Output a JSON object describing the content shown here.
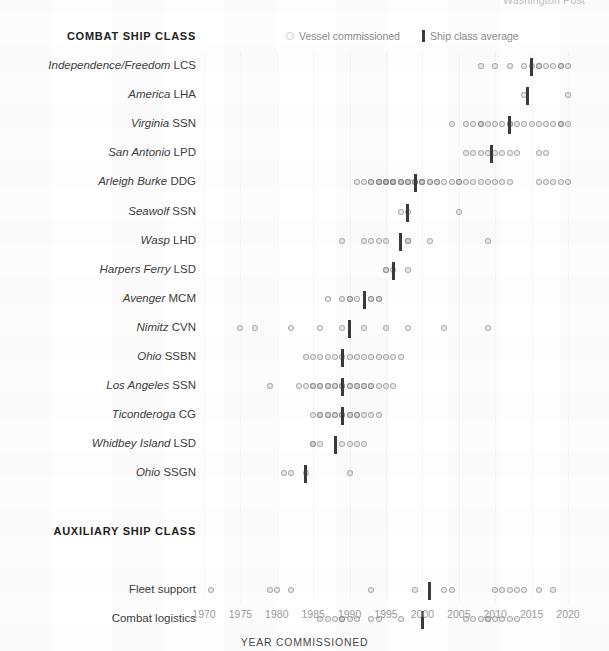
{
  "clipped_header": "Washington Post",
  "legend": {
    "dot_label": "Vessel commissioned",
    "bar_label": "Ship class average",
    "dot_icon": "circle-outline-icon",
    "bar_icon": "vertical-bar-icon"
  },
  "sections": {
    "combat_title": "COMBAT SHIP CLASS",
    "auxiliary_title": "AUXILIARY SHIP CLASS"
  },
  "axis": {
    "title": "YEAR COMMISSIONED",
    "ticks": [
      1970,
      1975,
      1980,
      1985,
      1990,
      1995,
      2000,
      2005,
      2010,
      2015,
      2020
    ],
    "min": 1968,
    "max": 2021
  },
  "colors": {
    "dot_stroke": "#8a8a8a",
    "avg_bar": "#3a3a3a",
    "text": "#3d3d3d",
    "tick_text": "#9a9a9a",
    "gridline": "#f0f0f0",
    "background": "#ffffff"
  },
  "chart_data": {
    "type": "scatter",
    "title": "COMBAT SHIP CLASS",
    "xlabel": "YEAR COMMISSIONED",
    "ylabel": "",
    "xlim": [
      1968,
      2021
    ],
    "grid": true,
    "legend_position": "top",
    "series": [
      {
        "group": "combat",
        "name_italic": "Independence/Freedom",
        "name_plain": "LCS",
        "average": 2015.0,
        "values": [
          2008,
          2010,
          2012,
          2014,
          2015,
          2016,
          2016,
          2017,
          2018,
          2019,
          2019,
          2020
        ]
      },
      {
        "group": "combat",
        "name_italic": "America",
        "name_plain": "LHA",
        "average": 2014.5,
        "values": [
          2014,
          2020
        ]
      },
      {
        "group": "combat",
        "name_italic": "Virginia",
        "name_plain": "SSN",
        "average": 2012.0,
        "values": [
          2004,
          2006,
          2007,
          2008,
          2008,
          2009,
          2010,
          2011,
          2012,
          2012,
          2013,
          2014,
          2015,
          2016,
          2017,
          2018,
          2019,
          2019,
          2020
        ]
      },
      {
        "group": "combat",
        "name_italic": "San Antonio",
        "name_plain": "LPD",
        "average": 2009.5,
        "values": [
          2006,
          2007,
          2008,
          2009,
          2010,
          2011,
          2012,
          2013,
          2016,
          2017
        ]
      },
      {
        "group": "combat",
        "name_italic": "Arleigh Burke",
        "name_plain": "DDG",
        "average": 1999.0,
        "values": [
          1991,
          1992,
          1993,
          1993,
          1994,
          1994,
          1994,
          1995,
          1995,
          1995,
          1995,
          1996,
          1996,
          1996,
          1996,
          1997,
          1997,
          1997,
          1998,
          1998,
          1998,
          1999,
          1999,
          1999,
          2000,
          2000,
          2000,
          2001,
          2001,
          2002,
          2002,
          2003,
          2004,
          2005,
          2005,
          2006,
          2007,
          2008,
          2009,
          2010,
          2011,
          2012,
          2016,
          2017,
          2018,
          2019,
          2020
        ]
      },
      {
        "group": "combat",
        "name_italic": "Seawolf",
        "name_plain": "SSN",
        "average": 1998.0,
        "values": [
          1997,
          1998,
          2005
        ]
      },
      {
        "group": "combat",
        "name_italic": "Wasp",
        "name_plain": "LHD",
        "average": 1997.0,
        "values": [
          1989,
          1992,
          1993,
          1994,
          1995,
          1998,
          1998,
          2001,
          2009
        ]
      },
      {
        "group": "combat",
        "name_italic": "Harpers Ferry",
        "name_plain": "LSD",
        "average": 1996.0,
        "values": [
          1995,
          1995,
          1996,
          1998
        ]
      },
      {
        "group": "combat",
        "name_italic": "Avenger",
        "name_plain": "MCM",
        "average": 1992.0,
        "values": [
          1987,
          1989,
          1990,
          1990,
          1991,
          1993,
          1993,
          1994,
          1994
        ]
      },
      {
        "group": "combat",
        "name_italic": "Nimitz",
        "name_plain": "CVN",
        "average": 1990.0,
        "values": [
          1975,
          1977,
          1982,
          1986,
          1989,
          1992,
          1995,
          1998,
          2003,
          2009
        ]
      },
      {
        "group": "combat",
        "name_italic": "Ohio",
        "name_plain": "SSBN",
        "average": 1989.0,
        "values": [
          1984,
          1985,
          1986,
          1987,
          1988,
          1989,
          1990,
          1991,
          1992,
          1993,
          1994,
          1995,
          1996,
          1997
        ]
      },
      {
        "group": "combat",
        "name_italic": "Los Angeles",
        "name_plain": "SSN",
        "average": 1989.0,
        "values": [
          1979,
          1983,
          1984,
          1985,
          1985,
          1986,
          1986,
          1987,
          1987,
          1988,
          1988,
          1989,
          1989,
          1990,
          1990,
          1991,
          1991,
          1992,
          1992,
          1993,
          1993,
          1994,
          1995,
          1996
        ]
      },
      {
        "group": "combat",
        "name_italic": "Ticonderoga",
        "name_plain": "CG",
        "average": 1989.0,
        "values": [
          1985,
          1986,
          1986,
          1987,
          1987,
          1988,
          1988,
          1989,
          1989,
          1990,
          1990,
          1991,
          1991,
          1992,
          1993,
          1994
        ]
      },
      {
        "group": "combat",
        "name_italic": "Whidbey Island",
        "name_plain": "LSD",
        "average": 1988.0,
        "values": [
          1985,
          1985,
          1986,
          1989,
          1990,
          1991,
          1992
        ]
      },
      {
        "group": "combat",
        "name_italic": "Ohio",
        "name_plain": "SSGN",
        "average": 1984.0,
        "values": [
          1981,
          1982,
          1984,
          1990
        ]
      },
      {
        "group": "auxiliary",
        "name_italic": "",
        "name_plain": "Fleet support",
        "average": 2001.0,
        "values": [
          1971,
          1979,
          1980,
          1982,
          1993,
          1999,
          2003,
          2004,
          2010,
          2011,
          2012,
          2013,
          2014,
          2016,
          2018
        ]
      },
      {
        "group": "auxiliary",
        "name_italic": "",
        "name_plain": "Combat logistics",
        "average": 2000.0,
        "values": [
          1986,
          1987,
          1988,
          1989,
          1989,
          1990,
          1991,
          1993,
          1994,
          1997,
          2006,
          2007,
          2008,
          2009,
          2009,
          2010,
          2011,
          2012,
          2013
        ]
      }
    ]
  }
}
